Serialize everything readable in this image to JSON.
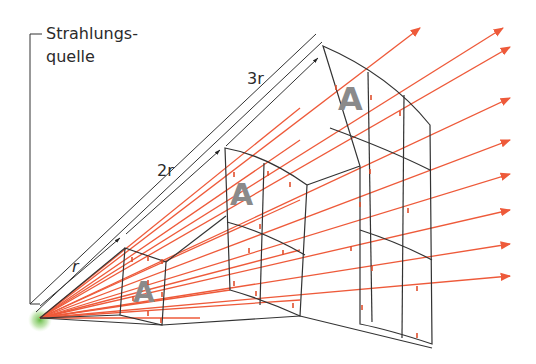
{
  "labels": {
    "source_line1": "Strahlungs-",
    "source_line2": "quelle",
    "dist_r": "r",
    "dist_2r": "2r",
    "dist_3r": "3r",
    "area_small": "A",
    "area_mid": "A",
    "area_large": "A"
  },
  "colors": {
    "ray": "#ee5a3a",
    "frame": "#333333",
    "area_letter": "#8a8a8a",
    "source_glow": "#6cc04a"
  },
  "source": {
    "x": 40,
    "y": 318
  },
  "rays_arrow_ends": [
    [
      321,
      28
    ],
    [
      503,
      28
    ],
    [
      509,
      47
    ],
    [
      510,
      98
    ],
    [
      510,
      140
    ],
    [
      510,
      174
    ],
    [
      510,
      210
    ],
    [
      510,
      244
    ],
    [
      510,
      276
    ]
  ]
}
